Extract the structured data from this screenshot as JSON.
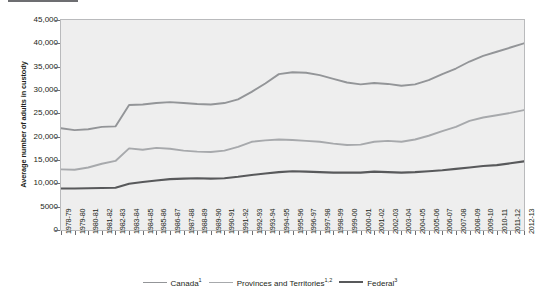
{
  "title": {
    "rule_color": "#6d6e71",
    "text": "Average number of adults in custody"
  },
  "chart_data": {
    "type": "line",
    "title": "Average number of adults in custody",
    "xlabel": "",
    "ylabel": "Average number of adults in custody",
    "ylim": [
      0,
      45000
    ],
    "ytick_labels": [
      "45,000",
      "40,000",
      "35,000",
      "30,000",
      "25,000",
      "20,000",
      "15,000",
      "10,000",
      "5000",
      "0"
    ],
    "ytick_values": [
      45000,
      40000,
      35000,
      30000,
      25000,
      20000,
      15000,
      10000,
      5000,
      0
    ],
    "grid": false,
    "legend_position": "bottom",
    "categories": [
      "1978-79",
      "1979-80",
      "1980-81",
      "1981-82",
      "1982-83",
      "1983-84",
      "1984-85",
      "1985-86",
      "1986-87",
      "1987-88",
      "1988-89",
      "1989-90",
      "1990-91",
      "1991-92",
      "1992-93",
      "1993-94",
      "1994-95",
      "1995-96",
      "1996-97",
      "1997-98",
      "1998-99",
      "1999-00",
      "2000-01",
      "2001-02",
      "2002-03",
      "2003-04",
      "2004-05",
      "2005-06",
      "2006-07",
      "2007-08",
      "2008-09",
      "2009-10",
      "2010-11",
      "2011-12",
      "2012-13"
    ],
    "series": [
      {
        "name": "Canada",
        "superscript": "1",
        "color": "#939598",
        "width": 1.9,
        "values": [
          21800,
          21400,
          21600,
          22100,
          22200,
          26800,
          26900,
          27200,
          27400,
          27200,
          27000,
          26900,
          27200,
          28000,
          29600,
          31400,
          33400,
          33800,
          33700,
          33200,
          32400,
          31600,
          31200,
          31500,
          31300,
          30900,
          31200,
          32100,
          33400,
          34600,
          36100,
          37300,
          38200,
          39100,
          40000
        ]
      },
      {
        "name": "Provinces and Territories",
        "superscript": "1,2",
        "color": "#a7a9ac",
        "width": 1.9,
        "values": [
          13000,
          12900,
          13400,
          14200,
          14800,
          17500,
          17200,
          17600,
          17400,
          17000,
          16800,
          16700,
          17000,
          17800,
          18900,
          19200,
          19400,
          19300,
          19100,
          18900,
          18500,
          18200,
          18300,
          18900,
          19100,
          18900,
          19400,
          20200,
          21200,
          22100,
          23400,
          24100,
          24600,
          25100,
          25700
        ]
      },
      {
        "name": "Federal",
        "superscript": "3",
        "color": "#58595b",
        "width": 2.1,
        "values": [
          8900,
          8900,
          8950,
          9000,
          9050,
          9900,
          10300,
          10600,
          10900,
          11000,
          11100,
          11000,
          11100,
          11400,
          11800,
          12100,
          12400,
          12600,
          12500,
          12400,
          12300,
          12300,
          12300,
          12500,
          12400,
          12300,
          12400,
          12600,
          12800,
          13100,
          13400,
          13700,
          13900,
          14300,
          14700
        ]
      }
    ]
  },
  "legend": {
    "items": [
      {
        "label": "Canada",
        "sup": "1",
        "color": "#939598",
        "width": 1.9
      },
      {
        "label": "Provinces and Territories",
        "sup": "1,2",
        "color": "#a7a9ac",
        "width": 1.9
      },
      {
        "label": "Federal",
        "sup": "3",
        "color": "#58595b",
        "width": 2.6
      }
    ]
  }
}
